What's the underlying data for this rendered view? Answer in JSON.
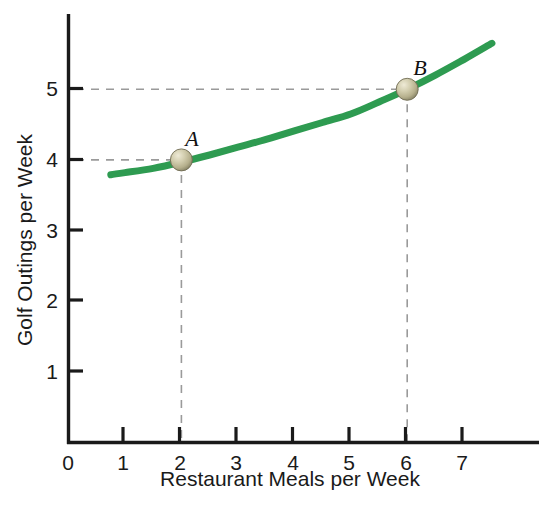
{
  "chart_data": {
    "type": "line",
    "title": "",
    "subtitle": "",
    "xlabel": "Restaurant Meals per Week",
    "ylabel": "Golf Outings per Week",
    "xlim": [
      0,
      7.9
    ],
    "ylim": [
      0,
      6.05
    ],
    "x_ticks": [
      0,
      1,
      2,
      3,
      4,
      5,
      6,
      7
    ],
    "x_tick_labels": [
      "0",
      "1",
      "2",
      "3",
      "4",
      "5",
      "6",
      "7"
    ],
    "y_ticks": [
      1,
      2,
      3,
      4,
      5
    ],
    "y_tick_labels": [
      "1",
      "2",
      "3",
      "4",
      "5"
    ],
    "grid": false,
    "legend": "none",
    "series": [
      {
        "name": "indifference curve",
        "color": "#2E9B51",
        "line_width_px": 7,
        "x": [
          0.75,
          1.0,
          1.5,
          2.0,
          2.5,
          3.0,
          3.5,
          4.0,
          4.5,
          5.0,
          5.5,
          6.0,
          6.5,
          7.0,
          7.5
        ],
        "y": [
          3.79,
          3.82,
          3.88,
          3.97,
          4.07,
          4.18,
          4.29,
          4.41,
          4.53,
          4.65,
          4.82,
          5.0,
          5.2,
          5.42,
          5.65
        ]
      }
    ],
    "points": [
      {
        "label": "A",
        "x": 2,
        "y": 4,
        "marker": "sphere",
        "marker_color": "#BDB894"
      },
      {
        "label": "B",
        "x": 6,
        "y": 5,
        "marker": "sphere",
        "marker_color": "#BDB894"
      }
    ],
    "guide_lines": [
      {
        "from_point": "A",
        "orientation": "horizontal",
        "value": 4,
        "style": "dashed",
        "color": "#9a9a9a"
      },
      {
        "from_point": "A",
        "orientation": "vertical",
        "value": 2,
        "style": "dashed",
        "color": "#9a9a9a"
      },
      {
        "from_point": "B",
        "orientation": "horizontal",
        "value": 5,
        "style": "dashed",
        "color": "#9a9a9a"
      },
      {
        "from_point": "B",
        "orientation": "vertical",
        "value": 6,
        "style": "dashed",
        "color": "#9a9a9a"
      }
    ],
    "colors": {
      "curve": "#2E9B51",
      "axis": "#1a1a1a",
      "guide": "#9a9a9a",
      "marker": "#BDB894",
      "background": "#ffffff"
    }
  }
}
